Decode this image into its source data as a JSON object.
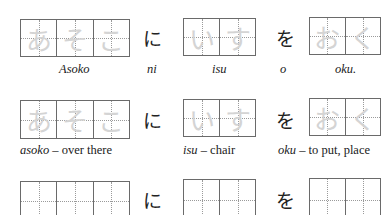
{
  "rows": [
    {
      "words": [
        {
          "kana": [
            "あ",
            "そ",
            "こ"
          ],
          "label_romaji": "Asoko",
          "label_meaning": ""
        },
        {
          "kana": [
            "い",
            "す"
          ],
          "label_romaji": "isu",
          "label_meaning": ""
        },
        {
          "kana": [
            "お",
            "く"
          ],
          "label_romaji": "oku.",
          "label_meaning": ""
        }
      ],
      "particles": [
        {
          "kana": "に",
          "romaji": "ni"
        },
        {
          "kana": "を",
          "romaji": "o"
        }
      ]
    },
    {
      "words": [
        {
          "kana": [
            "あ",
            "そ",
            "こ"
          ],
          "label_romaji": "asoko",
          "label_meaning": " – over there"
        },
        {
          "kana": [
            "い",
            "す"
          ],
          "label_romaji": "isu",
          "label_meaning": " – chair"
        },
        {
          "kana": [
            "お",
            "く"
          ],
          "label_romaji": "oku",
          "label_meaning": " – to put, place"
        }
      ],
      "particles": [
        {
          "kana": "に",
          "romaji": ""
        },
        {
          "kana": "を",
          "romaji": ""
        }
      ]
    },
    {
      "words": [
        {
          "kana": [
            "",
            "",
            ""
          ]
        },
        {
          "kana": [
            "",
            ""
          ]
        },
        {
          "kana": [
            "",
            ""
          ]
        }
      ],
      "particles": [
        {
          "kana": "に",
          "romaji": ""
        },
        {
          "kana": "を",
          "romaji": ""
        }
      ]
    }
  ]
}
